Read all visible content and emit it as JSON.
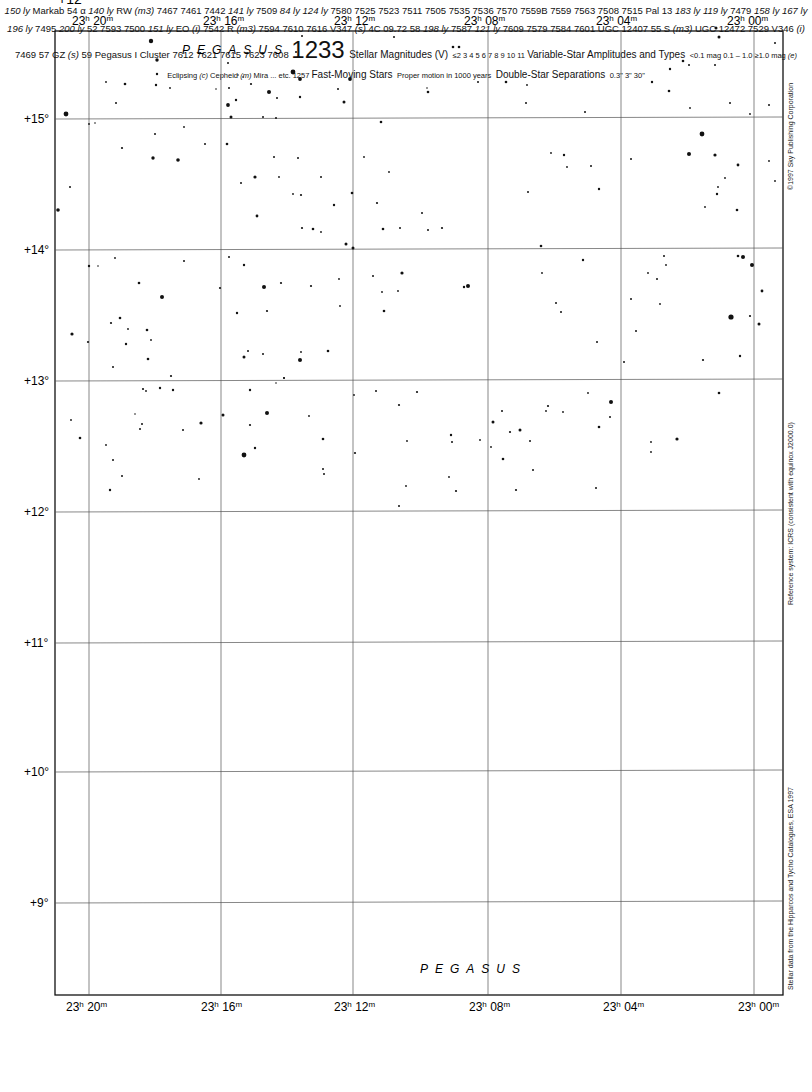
{
  "chart_number": "1233",
  "constellation": "PEGASUS",
  "ra_labels": [
    {
      "text": "23h 20m",
      "x": 89
    },
    {
      "text": "23h 16m",
      "x": 221
    },
    {
      "text": "23h 12m",
      "x": 353
    },
    {
      "text": "23h 08m",
      "x": 488
    },
    {
      "text": "23h 04m",
      "x": 621
    },
    {
      "text": "23h 00m",
      "x": 754
    }
  ],
  "dec_labels": [
    {
      "text": "+15°",
      "y": 119
    },
    {
      "text": "+14°",
      "y": 250
    },
    {
      "text": "+13°",
      "y": 381
    },
    {
      "text": "+12°",
      "y": 512
    },
    {
      "text": "+11°",
      "y": 643
    },
    {
      "text": "+10°",
      "y": 772
    },
    {
      "text": "+9°",
      "y": 903
    }
  ],
  "side_notes": {
    "copyright": "©1997 Sky Publishing Corporation",
    "reference": "Reference system: ICRS (consistent with equinox J2000.0)",
    "source": "Stellar data from the Hipparcos and Tycho Catalogues, ESA 1997"
  },
  "named_stars": [
    {
      "name": "Markab",
      "designation": "54 α",
      "distance": "140 ly"
    },
    {
      "name": "52"
    },
    {
      "name": "55"
    },
    {
      "name": "57"
    },
    {
      "name": "58"
    },
    {
      "name": "59"
    }
  ],
  "variables": [
    "RW (m3)",
    "R (m3)",
    "S (m3)",
    "EO (i)",
    "V347 (s)",
    "V346 (i)",
    "GZ (s)"
  ],
  "deep_sky": [
    "7442",
    "7461",
    "7467",
    "7469",
    "7479",
    "7495",
    "7500",
    "7505",
    "7508",
    "7509",
    "7511",
    "7515",
    "7523",
    "7525",
    "7529",
    "7535",
    "7536",
    "7542",
    "7559",
    "7559B",
    "7563",
    "7570",
    "7579",
    "7580",
    "7584",
    "7587",
    "7593",
    "7594",
    "7601",
    "7608",
    "7609",
    "7610",
    "7612",
    "7615",
    "7616",
    "7621",
    "7623",
    "UGC 12407",
    "UGC 12472",
    "Pal 13",
    "4C 09.72",
    "Pegasus I Cluster"
  ],
  "distances": [
    "150 ly",
    "141 ly",
    "140 ly",
    "84 ly",
    "124 ly",
    "183 ly",
    "119 ly",
    "158 ly",
    "167 ly",
    "196 ly",
    "200 ly",
    "151 ly",
    "198 ly",
    "121 ly"
  ],
  "legend": {
    "magnitudes": {
      "title": "Stellar Magnitudes (V)",
      "labels": [
        "≤2",
        "3",
        "4",
        "5",
        "6",
        "7",
        "8",
        "9",
        "10",
        "11"
      ]
    },
    "variables": {
      "title": "Variable-Star Amplitudes and Types",
      "amplitudes": [
        "<0.1 mag",
        "0.1 – 1.0",
        "≥1.0 mag"
      ],
      "types": [
        "(e) Eclipsing",
        "(c) Cepheid",
        "(m) Mira",
        "... etc."
      ]
    },
    "fast_moving": {
      "title": "Fast-Moving Stars",
      "caption": "Proper motion in 1000 years"
    },
    "double": {
      "title": "Double-Star Separations",
      "labels": [
        "0.3\"",
        "3\"",
        "30\""
      ]
    },
    "next_chart": "1257"
  }
}
